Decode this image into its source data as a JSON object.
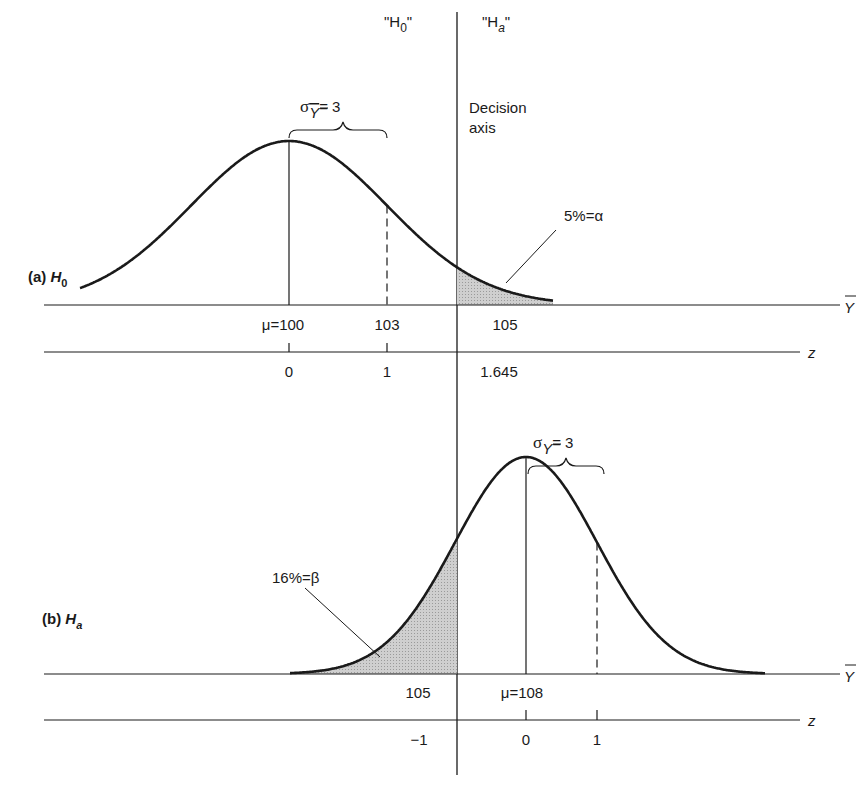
{
  "header": {
    "h0_label": "\"H",
    "h0_sub": "0",
    "h0_close": "\"",
    "ha_label": "\"H",
    "ha_sub": "a",
    "ha_close": "\"",
    "decision_axis_line1": "Decision",
    "decision_axis_line2": "axis"
  },
  "panel_a": {
    "title_prefix": "(a) ",
    "title_h": "H",
    "title_sub": "0",
    "sigma_label": "σ",
    "sigma_sub": "Y",
    "sigma_value": "= 3",
    "alpha_label": "5%=α",
    "ybar_ticks": [
      "μ=100",
      "103",
      "105"
    ],
    "z_ticks": [
      "0",
      "1",
      "1.645"
    ],
    "ybar_axis_label": "Y",
    "z_axis_label": "z"
  },
  "panel_b": {
    "title_prefix": "(b) ",
    "title_h": "H",
    "title_sub": "a",
    "sigma_label": "σ",
    "sigma_sub": "Y",
    "sigma_value": "= 3",
    "beta_label": "16%=β",
    "ybar_ticks": [
      "105",
      "μ=108"
    ],
    "z_ticks": [
      "−1",
      "0",
      "1"
    ],
    "ybar_axis_label": "Y",
    "z_axis_label": "z"
  },
  "chart_data": [
    {
      "type": "area",
      "title": "(a) H0",
      "description": "Sampling distribution of Y-bar under H0; normal curve with mean 100, standard error 3; upper tail beyond decision axis at 105 shaded (alpha = 5%)",
      "mean": 100,
      "sd": 3,
      "critical_value": 105,
      "shaded_region": "right tail, Y-bar > 105",
      "shaded_area_pct": 5,
      "annotation": "5%=α",
      "ybar_ticks": [
        100,
        103,
        105
      ],
      "z_ticks": [
        0,
        1,
        1.645
      ],
      "xlabel": "Y-bar",
      "secondary_xlabel": "z"
    },
    {
      "type": "area",
      "title": "(b) Ha",
      "description": "Sampling distribution of Y-bar under Ha; normal curve with mean 108, standard error 3; lower tail below decision axis at 105 shaded (beta = 16%)",
      "mean": 108,
      "sd": 3,
      "critical_value": 105,
      "shaded_region": "left tail, Y-bar < 105",
      "shaded_area_pct": 16,
      "annotation": "16%=β",
      "ybar_ticks": [
        105,
        108
      ],
      "z_ticks": [
        -1,
        0,
        1
      ],
      "xlabel": "Y-bar",
      "secondary_xlabel": "z"
    }
  ],
  "colors": {
    "ink": "#1a1a1a",
    "shade": "#bdbdbd",
    "background": "#ffffff"
  }
}
